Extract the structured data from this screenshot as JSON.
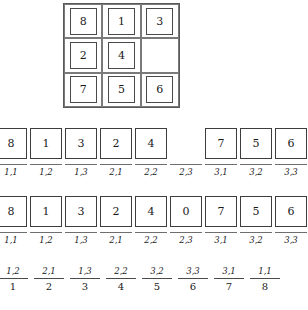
{
  "figure": {
    "puzzle": {
      "rows": [
        [
          {
            "value": "8",
            "blank": false
          },
          {
            "value": "1",
            "blank": false
          },
          {
            "value": "3",
            "blank": false
          }
        ],
        [
          {
            "value": "2",
            "blank": false
          },
          {
            "value": "4",
            "blank": false
          },
          {
            "value": "",
            "blank": true
          }
        ],
        [
          {
            "value": "7",
            "blank": false
          },
          {
            "value": "5",
            "blank": false
          },
          {
            "value": "6",
            "blank": false
          }
        ]
      ]
    },
    "array_row_1": {
      "cells": [
        {
          "value": "8",
          "label": "1,1",
          "empty": false
        },
        {
          "value": "1",
          "label": "1,2",
          "empty": false
        },
        {
          "value": "3",
          "label": "1,3",
          "empty": false
        },
        {
          "value": "2",
          "label": "2,1",
          "empty": false
        },
        {
          "value": "4",
          "label": "2,2",
          "empty": false
        },
        {
          "value": "",
          "label": "2,3",
          "empty": true
        },
        {
          "value": "7",
          "label": "3,1",
          "empty": false
        },
        {
          "value": "5",
          "label": "3,2",
          "empty": false
        },
        {
          "value": "6",
          "label": "3,3",
          "empty": false
        }
      ]
    },
    "array_row_2": {
      "cells": [
        {
          "value": "8",
          "label": "1,1",
          "empty": false
        },
        {
          "value": "1",
          "label": "1,2",
          "empty": false
        },
        {
          "value": "3",
          "label": "1,3",
          "empty": false
        },
        {
          "value": "2",
          "label": "2,1",
          "empty": false
        },
        {
          "value": "4",
          "label": "2,2",
          "empty": false
        },
        {
          "value": "0",
          "label": "2,3",
          "empty": false
        },
        {
          "value": "7",
          "label": "3,1",
          "empty": false
        },
        {
          "value": "5",
          "label": "3,2",
          "empty": false
        },
        {
          "value": "6",
          "label": "3,3",
          "empty": false
        }
      ]
    },
    "fraction_row": {
      "items": [
        {
          "numerator": "1,2",
          "denominator": "1"
        },
        {
          "numerator": "2,1",
          "denominator": "2"
        },
        {
          "numerator": "1,3",
          "denominator": "3"
        },
        {
          "numerator": "2,2",
          "denominator": "4"
        },
        {
          "numerator": "3,2",
          "denominator": "5"
        },
        {
          "numerator": "3,3",
          "denominator": "6"
        },
        {
          "numerator": "3,1",
          "denominator": "7"
        },
        {
          "numerator": "1,1",
          "denominator": "8"
        }
      ]
    }
  }
}
